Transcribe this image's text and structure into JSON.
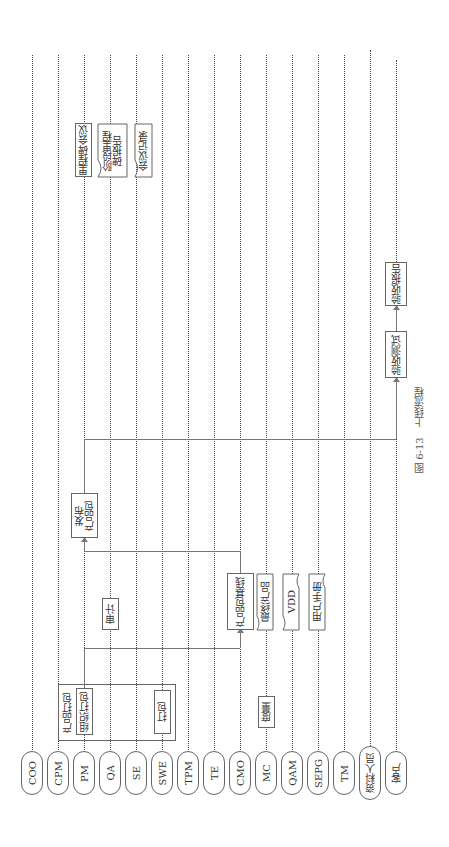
{
  "diagram": {
    "type": "swimlane-flowchart",
    "orientation": "rotated-90-ccw",
    "caption": "图 6-13　上线流程",
    "lanes": [
      {
        "id": "coo",
        "label": "COO",
        "x": 32
      },
      {
        "id": "cpm",
        "label": "CPM",
        "x": 58
      },
      {
        "id": "pm",
        "label": "PM",
        "x": 84
      },
      {
        "id": "qa",
        "label": "QA",
        "x": 110
      },
      {
        "id": "se",
        "label": "SE",
        "x": 136
      },
      {
        "id": "swe",
        "label": "SWE",
        "x": 162
      },
      {
        "id": "tpm",
        "label": "TPM",
        "x": 188
      },
      {
        "id": "te",
        "label": "TE",
        "x": 214
      },
      {
        "id": "cmo",
        "label": "CMO",
        "x": 240
      },
      {
        "id": "mc",
        "label": "MC",
        "x": 266
      },
      {
        "id": "qam",
        "label": "QAM",
        "x": 292
      },
      {
        "id": "sepg",
        "label": "SEPG",
        "x": 318
      },
      {
        "id": "tm",
        "label": "TM",
        "x": 344
      },
      {
        "id": "writer",
        "label": "资料人员",
        "x": 370
      },
      {
        "id": "customer",
        "label": "客户",
        "x": 396
      }
    ],
    "group": {
      "label": "产品打包"
    },
    "nodes": {
      "organize_packaging": {
        "label": "组织打包",
        "lane": "PM",
        "shape": "process"
      },
      "packaging": {
        "label": "打包",
        "lane": "SWE",
        "shape": "process"
      },
      "metrics": {
        "label": "度量",
        "lane": "MC",
        "shape": "process"
      },
      "audit": {
        "label": "审计",
        "lane": "QA",
        "shape": "process"
      },
      "baseline": {
        "label": "产品包基线",
        "lane": "CMO",
        "shape": "process"
      },
      "final_product": {
        "label": "最终产品",
        "lane": "MC",
        "shape": "document"
      },
      "vdd": {
        "label": "VDD",
        "lane": "QAM",
        "shape": "document"
      },
      "user_manual": {
        "label": "用户手册",
        "lane": "SEPG",
        "shape": "document"
      },
      "release": {
        "label": "发布\n产品包",
        "line1": "发布",
        "line2": "产品包",
        "lane": "PM",
        "shape": "process"
      },
      "acceptance_test": {
        "label": "验收测试",
        "lane": "客户",
        "shape": "process"
      },
      "acceptance_report": {
        "label": "验收报告",
        "lane": "客户",
        "shape": "process"
      },
      "milestone_meeting": {
        "label": "里程碑会议",
        "lane": "PM",
        "shape": "process"
      },
      "milestone_report": {
        "label": "阶段里程碑报告",
        "line1": "阶段里程",
        "line2": "碑报告",
        "lane": "QA",
        "shape": "document"
      },
      "meeting_minutes": {
        "label": "会议记录",
        "lane": "SE",
        "shape": "document"
      }
    },
    "edges": [
      {
        "from": "组织打包",
        "to": "产品包基线"
      },
      {
        "from": "产品包基线",
        "to": "发布产品包"
      },
      {
        "from": "发布产品包",
        "to": "验收测试"
      },
      {
        "from": "验收测试",
        "to": "验收报告"
      }
    ]
  }
}
